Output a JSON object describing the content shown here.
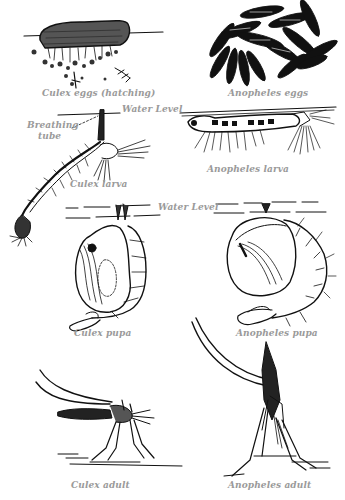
{
  "figure": {
    "panels": [
      {
        "id": "culex-eggs",
        "label": "Culex eggs (hatching)"
      },
      {
        "id": "anopheles-eggs",
        "label": "Anopheles eggs"
      },
      {
        "id": "culex-larva",
        "label": "Culex larva"
      },
      {
        "id": "anopheles-larva",
        "label": "Anopheles larva"
      },
      {
        "id": "culex-pupa",
        "label": "Culex pupa"
      },
      {
        "id": "anopheles-pupa",
        "label": "Anopheles pupa"
      },
      {
        "id": "culex-adult",
        "label": "Culex adult"
      },
      {
        "id": "anopheles-adult",
        "label": "Anopheles adult"
      }
    ],
    "annotations": {
      "water_level_larva": "Water Level",
      "water_level_pupa": "Water Level",
      "breathing_tube_line1": "Breathing",
      "breathing_tube_line2": "tube"
    }
  }
}
